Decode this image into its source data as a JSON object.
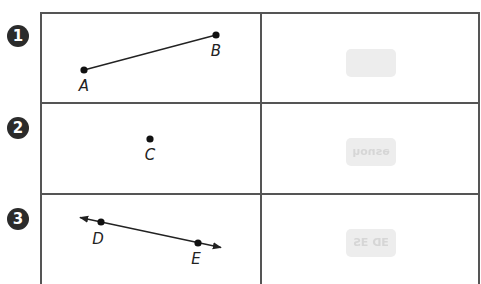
{
  "rows": [
    {
      "number": "1",
      "figure_type": "segment",
      "points": [
        {
          "label": "A",
          "x": 84,
          "y": 70,
          "label_x": 84,
          "label_y": 91
        },
        {
          "label": "B",
          "x": 216,
          "y": 35,
          "label_x": 216,
          "label_y": 56
        }
      ],
      "answer_thumb": ""
    },
    {
      "number": "2",
      "figure_type": "point",
      "points": [
        {
          "label": "C",
          "x": 150,
          "y": 139,
          "label_x": 150,
          "label_y": 160
        }
      ],
      "answer_thumb": "ǝsnoɥ"
    },
    {
      "number": "3",
      "figure_type": "line",
      "points": [
        {
          "label": "D",
          "x": 101,
          "y": 222,
          "label_x": 98,
          "label_y": 244
        },
        {
          "label": "E",
          "x": 198,
          "y": 243,
          "label_x": 196,
          "label_y": 264
        }
      ],
      "answer_thumb": "ƎD ƎS"
    }
  ],
  "colors": {
    "ink": "#222222",
    "grid": "#555555",
    "badge": "#2b2b2b",
    "thumb_bg": "#ededed"
  }
}
